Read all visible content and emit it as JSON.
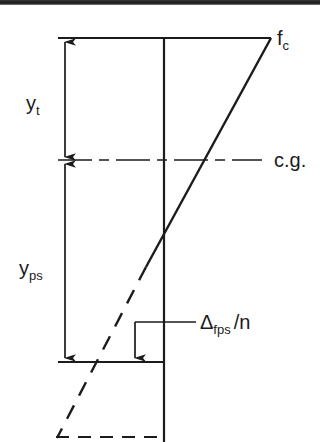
{
  "figure": {
    "background_color": "#ffffff",
    "line_color": "#1b1b1b",
    "scan_band_color": "#1a1a1a"
  },
  "labels": {
    "fc": {
      "base": "f",
      "sub": "c"
    },
    "yt": {
      "base": "y",
      "sub": "t"
    },
    "yps": {
      "base": "y",
      "sub": "ps"
    },
    "cg": {
      "text": "c.g."
    },
    "dfps": {
      "base": "Δ",
      "sub": "fps",
      "suffix": "/n"
    }
  },
  "geometry": {
    "beam_axis_x": 164,
    "dimension_line_x": 65,
    "top_y": 38,
    "cg_y": 160,
    "bottom_y": 362,
    "diagram_bottom_y": 437,
    "stress_top_right_x": 270,
    "neutral_cross_y": 243,
    "delta_arrow_x": 135,
    "leader_y": 322
  },
  "elements": {
    "top_line": "horizontal line at top of section",
    "cg_line": "dash-dot centroid axis line",
    "bottom_line": "horizontal line at prestress level",
    "beam_vertical": "vertical reference axis of section",
    "stress_diagonal_solid": "solid compressive stress gradient line",
    "stress_diagonal_dashed": "dashed tensile stress gradient extension",
    "bottom_dashed_line": "dashed horizontal line at section bottom",
    "yt_dimension": "double headed dimension arrow for y_t",
    "yps_dimension": "double headed dimension arrow for y_ps",
    "delta_leader": "leader line with down arrow for delta f_ps / n",
    "cg_leader": "leader line to c.g. label",
    "fc_leader": "stress value label at top fiber"
  }
}
